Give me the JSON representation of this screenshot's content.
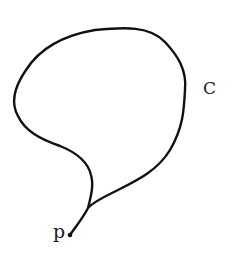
{
  "diagram": {
    "type": "closed-curve-loop",
    "curve_label": "C",
    "point_label": "p",
    "stroke_color": "#111111",
    "background_color": "#ffffff",
    "curve_path": "M70,235 C76,226 83,218 88,208 C91,196 94,185 91,175 C88,162 75,152 60,146 C40,139 25,131 18,116 C10,102 15,86 26,70 C40,48 65,35 95,30 C125,27 150,26 165,42 C178,56 187,70 185,90 C184,110 183,128 170,150 C158,170 138,180 118,190 C106,196 94,201 88,208",
    "point": {
      "x": 70,
      "y": 235,
      "r": 2.3
    }
  }
}
